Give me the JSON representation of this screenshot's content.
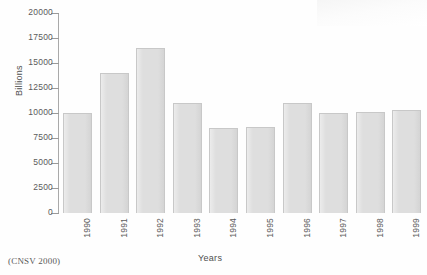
{
  "caption": "(CNSV 2000)",
  "chart_data": {
    "type": "bar",
    "title": "",
    "subtitle": "",
    "xlabel": "Years",
    "ylabel": "Billions",
    "categories": [
      "1990",
      "1991",
      "1992",
      "1993",
      "1994",
      "1995",
      "1996",
      "1997",
      "1998",
      "1999"
    ],
    "values": [
      10000,
      14000,
      16500,
      11000,
      8500,
      8600,
      11000,
      10000,
      10100,
      10300
    ],
    "ylim": [
      0,
      20000
    ],
    "yticks": [
      0,
      2500,
      5000,
      7500,
      10000,
      12500,
      15000,
      17500,
      20000
    ],
    "ytick_labels": [
      "0",
      "2500",
      "5000",
      "7500",
      "10000",
      "12500",
      "15000",
      "17500",
      "20000"
    ],
    "grid": false,
    "legend": null,
    "legend_position": "none",
    "bar_color": "#dedede",
    "bar_edge_color": "#c8c8c8",
    "axis_color": "#a9a9a9",
    "text_color": "#555555",
    "background_color": "#fefefe"
  }
}
